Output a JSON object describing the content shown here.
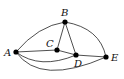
{
  "diagram": {
    "type": "graph",
    "nodes": [
      {
        "id": "A",
        "label": "A",
        "x": 16,
        "y": 52
      },
      {
        "id": "B",
        "label": "B",
        "x": 65,
        "y": 22
      },
      {
        "id": "C",
        "label": "C",
        "x": 57,
        "y": 50
      },
      {
        "id": "D",
        "label": "D",
        "x": 76,
        "y": 55
      },
      {
        "id": "E",
        "label": "E",
        "x": 106,
        "y": 57
      }
    ],
    "edges": [
      {
        "from": "A",
        "to": "B",
        "style": "curved"
      },
      {
        "from": "B",
        "to": "E",
        "style": "curved"
      },
      {
        "from": "B",
        "to": "C",
        "style": "straight"
      },
      {
        "from": "B",
        "to": "D",
        "style": "straight"
      },
      {
        "from": "A",
        "to": "C",
        "style": "straight"
      },
      {
        "from": "C",
        "to": "D",
        "style": "straight"
      },
      {
        "from": "D",
        "to": "E",
        "style": "straight"
      },
      {
        "from": "A",
        "to": "D",
        "style": "curved"
      },
      {
        "from": "A",
        "to": "E",
        "style": "curved"
      }
    ]
  }
}
